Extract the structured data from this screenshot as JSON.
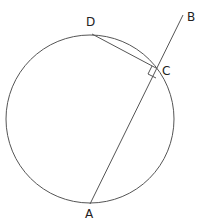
{
  "diagram": {
    "type": "geometry-circle",
    "circle": {
      "cx": 90,
      "cy": 119,
      "r": 84
    },
    "points": {
      "A": {
        "label": "A",
        "x": 90,
        "y": 204
      },
      "B": {
        "label": "B",
        "x": 183,
        "y": 15
      },
      "C": {
        "label": "C",
        "x": 156,
        "y": 68
      },
      "D": {
        "label": "D",
        "x": 92,
        "y": 34
      }
    },
    "segments": [
      {
        "from": "A",
        "to": "B",
        "label": "line AB (secant through C)"
      },
      {
        "from": "D",
        "to": "C",
        "label": "chord DC"
      }
    ],
    "right_angle_at": "C",
    "colors": {
      "stroke": "#555555",
      "text": "#222222",
      "background": "#ffffff"
    }
  }
}
